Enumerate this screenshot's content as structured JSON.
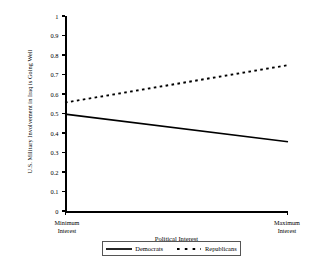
{
  "chart_data": {
    "type": "line",
    "title": "",
    "xlabel": "Political Interest",
    "ylabel": "U.S. Military Involvement in Iraq is Going Well",
    "xlim": [
      0,
      1
    ],
    "ylim": [
      0,
      1
    ],
    "grid": false,
    "legend_position": "bottom",
    "x": [
      0,
      1
    ],
    "x_tick_labels": [
      "Minimum Interest",
      "Maximum Interest"
    ],
    "x_tick_label_left_line1": "Minimum",
    "x_tick_label_left_line2": "Interest",
    "x_tick_label_right_line1": "Maximum",
    "x_tick_label_right_line2": "Interest",
    "y_ticks": [
      0,
      0.1,
      0.2,
      0.3,
      0.4,
      0.5,
      0.6,
      0.7,
      0.8,
      0.9,
      1
    ],
    "y_tick_labels": [
      "0",
      "0.1",
      "0.2",
      "0.3",
      "0.4",
      "0.5",
      "0.6",
      "0.7",
      "0.8",
      "0.9",
      "1"
    ],
    "series": [
      {
        "name": "Democrats",
        "style": "solid",
        "color": "#000000",
        "values": [
          0.497,
          0.355
        ]
      },
      {
        "name": "Republicans",
        "style": "dotted",
        "color": "#000000",
        "values": [
          0.556,
          0.748
        ]
      }
    ]
  },
  "legend": {
    "democrats_label": "Democrats",
    "republicans_label": "Republicans"
  }
}
